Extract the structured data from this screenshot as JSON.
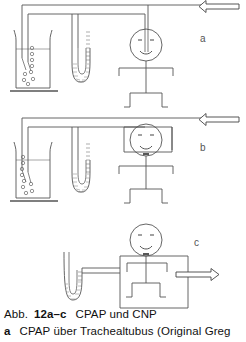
{
  "figure": {
    "number": "12a–c",
    "abbr_prefix": "Abb.",
    "title": "CPAP und CNP",
    "caption_line_1_prefix": "Abb.",
    "caption_line_1_number": "12a–c",
    "caption_line_1_text": "CPAP und CNP",
    "caption_line_2_marker": "a",
    "caption_line_2_text": "CPAP über Trachealtubus (Original Greg",
    "line_color": "#555555",
    "ink_color": "#333333",
    "background": "#ffffff"
  },
  "panels": [
    {
      "id": "a",
      "label": "a",
      "description": "CPAP über Trachealtubus",
      "components": [
        {
          "name": "humidifier-beaker",
          "label": ""
        },
        {
          "name": "water-manometer",
          "label": ""
        },
        {
          "name": "patient-figure",
          "label": ""
        },
        {
          "name": "gas-inflow-arrow",
          "direction": "left"
        }
      ]
    },
    {
      "id": "b",
      "label": "b",
      "description": "CPAP über Kopfkammer",
      "components": [
        {
          "name": "humidifier-beaker",
          "label": ""
        },
        {
          "name": "water-manometer",
          "label": ""
        },
        {
          "name": "patient-figure",
          "label": ""
        },
        {
          "name": "head-chamber",
          "label": ""
        },
        {
          "name": "gas-inflow-arrow",
          "direction": "left"
        }
      ]
    },
    {
      "id": "c",
      "label": "c",
      "description": "CNP im Körperkasten",
      "components": [
        {
          "name": "water-manometer",
          "label": ""
        },
        {
          "name": "patient-figure",
          "label": ""
        },
        {
          "name": "body-box",
          "label": ""
        },
        {
          "name": "suction-outflow-arrow",
          "direction": "right"
        }
      ]
    }
  ]
}
